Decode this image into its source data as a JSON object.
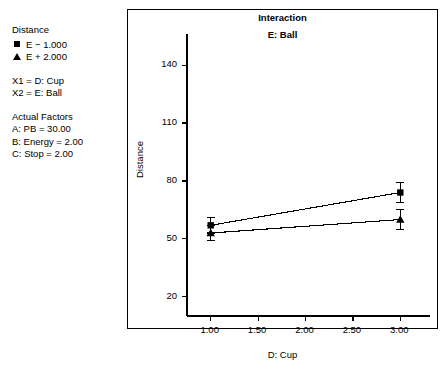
{
  "legend": {
    "title": "Distance",
    "entries": [
      {
        "marker": "square-marker",
        "label": "E − 1.000"
      },
      {
        "marker": "triangle-marker",
        "label": "E + 2.000"
      }
    ],
    "factor_map": [
      "X1 = D: Cup",
      "X2 = E: Ball"
    ],
    "actual_factors_title": "Actual Factors",
    "actual_factors": [
      "A: PB = 30.00",
      "B: Energy = 2.00",
      "C: Stop = 2.00"
    ]
  },
  "chart_data": {
    "type": "line",
    "title": "Interaction",
    "subtitle": "E: Ball",
    "xlabel": "D: Cup",
    "ylabel": "Distance",
    "xlim": [
      0.75,
      3.25
    ],
    "ylim": [
      10,
      152
    ],
    "xticks": [
      "1.00",
      "1.50",
      "2.00",
      "2.50",
      "3.00"
    ],
    "xtick_values": [
      1.0,
      1.5,
      2.0,
      2.5,
      3.0
    ],
    "yticks": [
      "20",
      "50",
      "80",
      "110",
      "140"
    ],
    "ytick_values": [
      20,
      50,
      80,
      110,
      140
    ],
    "grid": false,
    "legend_position": "outside-left",
    "x": [
      1.0,
      3.0
    ],
    "series": [
      {
        "name": "E − 1.000",
        "marker": "square-marker",
        "values": [
          57,
          74
        ],
        "error_upper": [
          61,
          79
        ],
        "error_lower": [
          53,
          69
        ]
      },
      {
        "name": "E + 2.000",
        "marker": "triangle-marker",
        "values": [
          53,
          60
        ],
        "error_upper": [
          57,
          65
        ],
        "error_lower": [
          49,
          55
        ]
      }
    ]
  }
}
